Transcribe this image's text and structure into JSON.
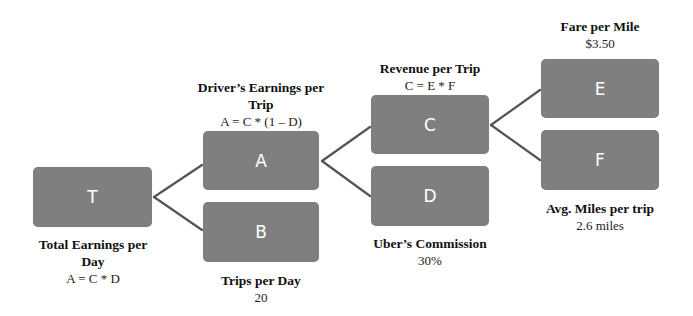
{
  "diagram": {
    "type": "driver-tree",
    "colors": {
      "node_fill": "#7f7f7f",
      "node_text": "#ffffff",
      "connector": "#555555"
    },
    "nodes": {
      "T": {
        "letter": "T",
        "title_line1": "Total Earnings per",
        "title_line2": "Day",
        "value": "A = C * D"
      },
      "A": {
        "letter": "A",
        "title_line1": "Driver’s Earnings per",
        "title_line2": "Trip",
        "value": "A = C * (1 – D)"
      },
      "B": {
        "letter": "B",
        "title": "Trips per Day",
        "value": "20"
      },
      "C": {
        "letter": "C",
        "title": "Revenue per Trip",
        "value": "C = E * F"
      },
      "D": {
        "letter": "D",
        "title": "Uber’s Commission",
        "value": "30%"
      },
      "E": {
        "letter": "E",
        "title": "Fare per Mile",
        "value": "$3.50"
      },
      "F": {
        "letter": "F",
        "title": "Avg. Miles per trip",
        "value": "2.6 miles"
      }
    },
    "edges": [
      {
        "from": "T",
        "to": "A"
      },
      {
        "from": "T",
        "to": "B"
      },
      {
        "from": "A",
        "to": "C"
      },
      {
        "from": "A",
        "to": "D"
      },
      {
        "from": "C",
        "to": "E"
      },
      {
        "from": "C",
        "to": "F"
      }
    ]
  }
}
